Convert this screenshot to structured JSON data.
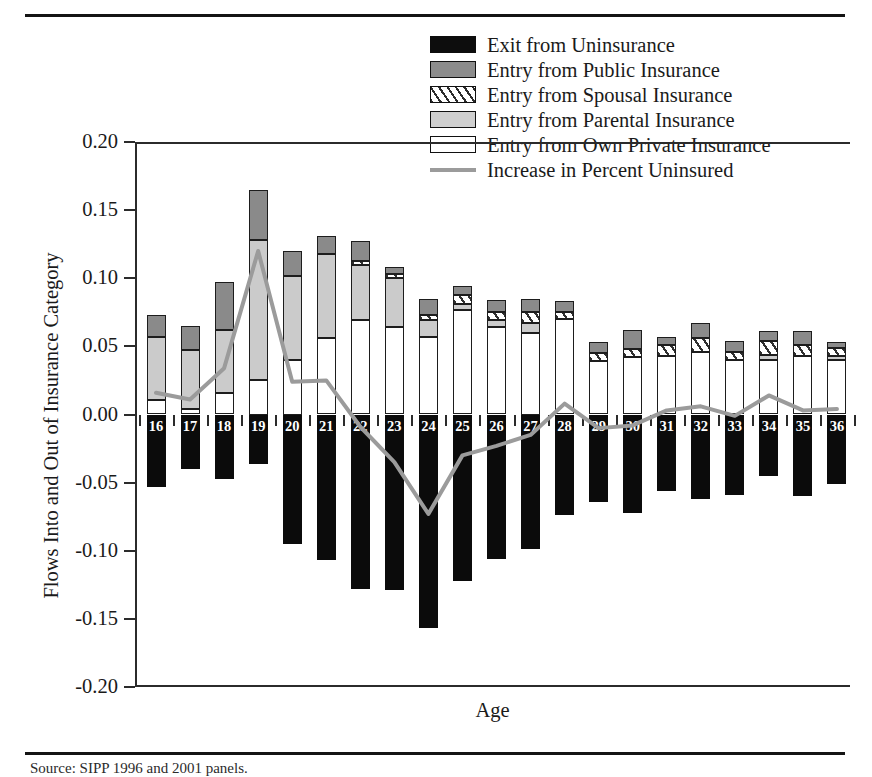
{
  "figure": {
    "ylabel": "Flows Into and Out of Insurance Category",
    "xlabel": "Age",
    "source_note": "Source: SIPP 1996 and 2001 panels."
  },
  "legend": {
    "items": [
      {
        "label": "Exit from Uninsurance",
        "swatch": "black",
        "color": "#0d0d0d"
      },
      {
        "label": "Entry from Public Insurance",
        "swatch": "public",
        "color": "#8c8c8c"
      },
      {
        "label": "Entry from Spousal Insurance",
        "swatch": "spousal",
        "color": "#ffffff"
      },
      {
        "label": "Entry from Parental Insurance",
        "swatch": "parental",
        "color": "#cfcfcf"
      },
      {
        "label": "Entry from Own Private Insurance",
        "swatch": "own",
        "color": "#ffffff"
      },
      {
        "label": "Increase in Percent Uninsured",
        "swatch": "line",
        "color": "#9b9b9b"
      }
    ]
  },
  "axes": {
    "ytick_labels": [
      "0.20",
      "0.15",
      "0.10",
      "0.05",
      "0.00",
      "-0.05",
      "-0.10",
      "-0.15",
      "-0.20"
    ],
    "ytick_values": [
      0.2,
      0.15,
      0.1,
      0.05,
      0.0,
      -0.05,
      -0.1,
      -0.15,
      -0.2
    ],
    "ylim": [
      -0.2,
      0.2
    ],
    "xlim_labels": [
      "16",
      "36"
    ]
  },
  "chart_data": {
    "type": "bar",
    "title": "",
    "xlabel": "Age",
    "ylabel": "Flows Into and Out of Insurance Category",
    "ylim": [
      -0.2,
      0.2
    ],
    "grid": false,
    "legend_position": "top-right",
    "categories": [
      "16",
      "17",
      "18",
      "19",
      "20",
      "21",
      "22",
      "23",
      "24",
      "25",
      "26",
      "27",
      "28",
      "29",
      "30",
      "31",
      "32",
      "33",
      "34",
      "35",
      "36"
    ],
    "series": [
      {
        "name": "Entry from Own Private Insurance",
        "stack": "positive",
        "stack_order": 1,
        "values": [
          0.011,
          0.004,
          0.016,
          0.025,
          0.04,
          0.056,
          0.069,
          0.064,
          0.057,
          0.077,
          0.064,
          0.06,
          0.07,
          0.039,
          0.042,
          0.043,
          0.046,
          0.04,
          0.04,
          0.043,
          0.04
        ]
      },
      {
        "name": "Entry from Parental Insurance",
        "stack": "positive",
        "stack_order": 2,
        "values": [
          0.046,
          0.043,
          0.046,
          0.103,
          0.062,
          0.062,
          0.041,
          0.036,
          0.012,
          0.004,
          0.005,
          0.007,
          0.0,
          0.0,
          0.0,
          0.0,
          0.0,
          0.0,
          0.004,
          0.0,
          0.003
        ]
      },
      {
        "name": "Entry from Spousal Insurance",
        "stack": "positive",
        "stack_order": 3,
        "values": [
          0.0,
          0.0,
          0.0,
          0.0,
          0.0,
          0.0,
          0.003,
          0.003,
          0.004,
          0.007,
          0.006,
          0.008,
          0.005,
          0.006,
          0.006,
          0.008,
          0.01,
          0.006,
          0.01,
          0.008,
          0.006
        ]
      },
      {
        "name": "Entry from Public Insurance",
        "stack": "positive",
        "stack_order": 4,
        "values": [
          0.016,
          0.018,
          0.035,
          0.037,
          0.018,
          0.013,
          0.014,
          0.005,
          0.012,
          0.006,
          0.009,
          0.01,
          0.008,
          0.008,
          0.014,
          0.006,
          0.011,
          0.008,
          0.007,
          0.01,
          0.004
        ]
      },
      {
        "name": "Exit from Uninsurance",
        "stack": "negative",
        "values": [
          -0.053,
          -0.04,
          -0.047,
          -0.036,
          -0.095,
          -0.107,
          -0.128,
          -0.129,
          -0.157,
          -0.122,
          -0.106,
          -0.099,
          -0.074,
          -0.064,
          -0.072,
          -0.056,
          -0.062,
          -0.059,
          -0.045,
          -0.06,
          -0.051
        ]
      }
    ],
    "line_series": {
      "name": "Increase in Percent Uninsured",
      "color": "#9b9b9b",
      "values": [
        0.016,
        0.011,
        0.034,
        0.12,
        0.024,
        0.025,
        -0.009,
        -0.035,
        -0.073,
        -0.03,
        -0.023,
        -0.015,
        0.008,
        -0.01,
        -0.008,
        0.003,
        0.006,
        -0.001,
        0.014,
        0.003,
        0.004
      ]
    }
  }
}
